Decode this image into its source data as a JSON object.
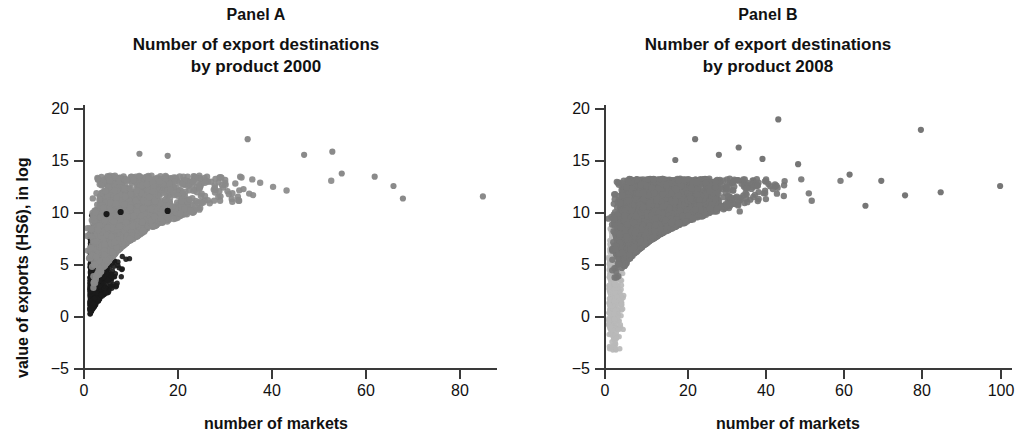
{
  "figure": {
    "background_color": "#ffffff",
    "axis_color": "#3a3a3a",
    "text_color": "#111111"
  },
  "panels": {
    "a": {
      "label": "Panel A",
      "title_line1": "Number of export destinations",
      "title_line2": "by product 2000",
      "xlabel": "number of markets",
      "ylabel": "value of exports (HS6), in log",
      "xticks": [
        "0",
        "20",
        "40",
        "60",
        "80"
      ],
      "yticks": [
        "20",
        "15",
        "10",
        "5",
        "0",
        "−5"
      ]
    },
    "b": {
      "label": "Panel B",
      "title_line1": "Number of export destinations",
      "title_line2": "by product 2008",
      "xlabel": "number of markets",
      "ylabel": "value of exports (HS6), in log",
      "xticks": [
        "0",
        "20",
        "40",
        "60",
        "80",
        "100"
      ],
      "yticks": [
        "20",
        "15",
        "10",
        "5",
        "0",
        "−5"
      ]
    }
  },
  "chart_data": [
    {
      "type": "scatter",
      "panel": "Panel A",
      "title": "Number of export destinations by product 2000",
      "xlabel": "number of markets",
      "ylabel": "value of exports (HS6), in log",
      "xlim": [
        0,
        88
      ],
      "ylim": [
        -5,
        21
      ],
      "xticks": [
        0,
        20,
        40,
        60,
        80
      ],
      "yticks": [
        -5,
        0,
        5,
        10,
        15,
        20
      ],
      "grid": false,
      "legend": null,
      "series": [
        {
          "name": "dense low-market cluster",
          "color": "#1a1a1a",
          "marker": "circle",
          "marker_size": 4,
          "n_points": 900,
          "description": "very dense near-black cloud concentrated between 0 and 15 markets, values from -2.5 up to about 10",
          "x_range": [
            0.5,
            18
          ],
          "y_range": [
            -2.5,
            10.3
          ],
          "cluster": {
            "x_mode": 1.5,
            "y_mode": 5.5,
            "x_decay": 3.2,
            "y_spread": 2.6,
            "lower_envelope_slope": 1.9,
            "lower_envelope_intercept": -2.6,
            "upper_cap": 10.4
          }
        },
        {
          "name": "main export cloud",
          "color": "#8a8a8a",
          "marker": "circle",
          "marker_size": 5,
          "n_points": 2600,
          "description": "medium-gray fan spreading right, lower edge rises logarithmically with number of markets, upper edge flat near 12-13",
          "x_range": [
            0.5,
            68
          ],
          "y_range": [
            -2.5,
            17
          ],
          "cluster": {
            "x_mode": 6,
            "x_decay": 14,
            "y_center_base": 6.5,
            "y_center_slope_log": 2.3,
            "y_spread": 2.3,
            "upper_cap": 13.5
          }
        }
      ],
      "outliers": [
        {
          "x": 35,
          "y": 17.0,
          "color": "#8a8a8a"
        },
        {
          "x": 18,
          "y": 15.4,
          "color": "#8a8a8a"
        },
        {
          "x": 12,
          "y": 15.6,
          "color": "#8a8a8a"
        },
        {
          "x": 47,
          "y": 15.5,
          "color": "#8a8a8a"
        },
        {
          "x": 53,
          "y": 15.8,
          "color": "#8a8a8a"
        },
        {
          "x": 55,
          "y": 13.7,
          "color": "#8a8a8a"
        },
        {
          "x": 62,
          "y": 13.4,
          "color": "#8a8a8a"
        },
        {
          "x": 66,
          "y": 12.5,
          "color": "#8a8a8a"
        },
        {
          "x": 68,
          "y": 11.3,
          "color": "#8a8a8a"
        },
        {
          "x": 85,
          "y": 11.5,
          "color": "#8a8a8a"
        },
        {
          "x": 5,
          "y": 9.8,
          "color": "#1a1a1a"
        },
        {
          "x": 8,
          "y": 10.0,
          "color": "#1a1a1a"
        },
        {
          "x": 18,
          "y": 10.1,
          "color": "#1a1a1a"
        }
      ]
    },
    {
      "type": "scatter",
      "panel": "Panel B",
      "title": "Number of export destinations by product 2008",
      "xlabel": "number of markets",
      "ylabel": "value of exports (HS6), in log",
      "xlim": [
        0,
        103
      ],
      "ylim": [
        -5,
        21
      ],
      "xticks": [
        0,
        20,
        40,
        60,
        80,
        100
      ],
      "yticks": [
        -5,
        0,
        5,
        10,
        15,
        20
      ],
      "grid": false,
      "legend": null,
      "series": [
        {
          "name": "low-market light cluster",
          "color": "#b8b8b8",
          "marker": "circle",
          "marker_size": 4,
          "n_points": 420,
          "description": "pale gray narrow column at 0-4 markets running from about -3.3 up to 8",
          "x_range": [
            0.5,
            5
          ],
          "y_range": [
            -3.3,
            8.5
          ],
          "cluster": {
            "x_mode": 1.2,
            "x_decay": 1.6,
            "y_mode": 2.5,
            "y_spread": 3.0
          }
        },
        {
          "name": "main export cloud",
          "color": "#767676",
          "marker": "circle",
          "marker_size": 5,
          "n_points": 4200,
          "description": "large dark-gray fan, denser and wider than 2000, lower edge rises logarithmically, upper edge flat near 12.5",
          "x_range": [
            0.5,
            72
          ],
          "y_range": [
            -3.0,
            16.5
          ],
          "cluster": {
            "x_mode": 9,
            "x_decay": 17,
            "y_center_base": 6.8,
            "y_center_slope_log": 2.2,
            "y_spread": 2.2,
            "upper_cap": 13.2
          }
        }
      ],
      "outliers": [
        {
          "x": 44,
          "y": 18.9,
          "color": "#767676"
        },
        {
          "x": 80,
          "y": 17.9,
          "color": "#767676"
        },
        {
          "x": 23,
          "y": 17.0,
          "color": "#767676"
        },
        {
          "x": 34,
          "y": 16.2,
          "color": "#767676"
        },
        {
          "x": 29,
          "y": 15.5,
          "color": "#767676"
        },
        {
          "x": 18,
          "y": 15.0,
          "color": "#767676"
        },
        {
          "x": 40,
          "y": 15.1,
          "color": "#767676"
        },
        {
          "x": 49,
          "y": 14.6,
          "color": "#767676"
        },
        {
          "x": 62,
          "y": 13.6,
          "color": "#767676"
        },
        {
          "x": 70,
          "y": 13.0,
          "color": "#767676"
        },
        {
          "x": 85,
          "y": 11.9,
          "color": "#767676"
        },
        {
          "x": 100,
          "y": 12.5,
          "color": "#767676"
        },
        {
          "x": 76,
          "y": 11.6,
          "color": "#767676"
        },
        {
          "x": 66,
          "y": 10.6,
          "color": "#767676"
        }
      ]
    }
  ]
}
